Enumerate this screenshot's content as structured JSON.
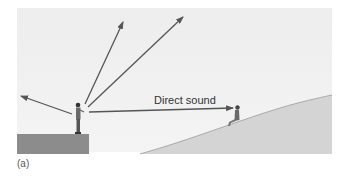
{
  "diagram": {
    "arrow_label": "Direct sound",
    "caption": "(a)",
    "colors": {
      "sky": "#eeeeee",
      "cliff": "#8a8a8a",
      "hill": "#d2d2d2",
      "arrow": "#555555",
      "text": "#333333"
    },
    "elements": {
      "speaker": "person standing on cliff edge",
      "listener": "person sitting on hillside",
      "arrows": [
        {
          "name": "arrow-left",
          "direction": "left-up"
        },
        {
          "name": "arrow-up-steep",
          "direction": "up"
        },
        {
          "name": "arrow-up-diagonal",
          "direction": "up-right"
        },
        {
          "name": "arrow-direct-sound",
          "direction": "right, to listener"
        }
      ]
    }
  }
}
